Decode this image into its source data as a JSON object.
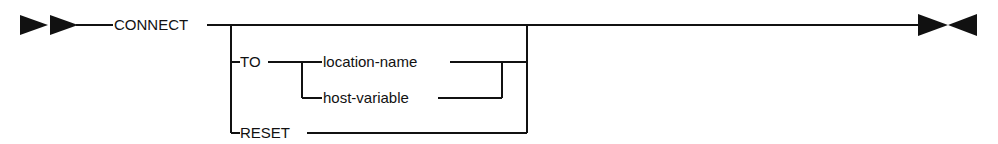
{
  "diagram": {
    "type": "syntax-railroad",
    "keyword": "CONNECT",
    "options": {
      "to": {
        "keyword": "TO",
        "choices": [
          "location-name",
          "host-variable"
        ]
      },
      "reset": {
        "keyword": "RESET"
      }
    },
    "start_symbol": "double-right-arrow",
    "end_symbol": "right-left-arrows",
    "color": "#111111"
  }
}
